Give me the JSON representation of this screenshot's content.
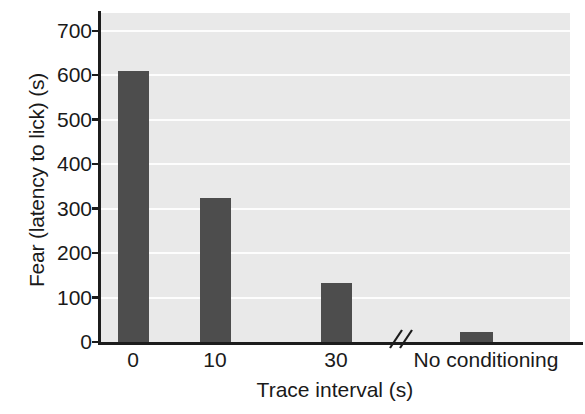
{
  "chart_data": {
    "type": "bar",
    "title": "",
    "xlabel": "Trace interval (s)",
    "ylabel": "Fear (latency to lick) (s)",
    "categories": [
      "0",
      "10",
      "30",
      "No conditioning"
    ],
    "values": [
      610,
      325,
      133,
      22
    ],
    "ylim": [
      0,
      740
    ],
    "yticks": [
      0,
      100,
      200,
      300,
      400,
      500,
      600,
      700
    ],
    "ytick_labels": [
      "0",
      "100",
      "200",
      "300",
      "400",
      "500",
      "600",
      "700"
    ],
    "grid": "horizontal",
    "legend": "none",
    "bar_color": "#4d4d4d",
    "plot_background": "#e9e9e9",
    "gridline_color": "#fdfdfd",
    "axis_color": "#1c1c1c",
    "annotations": [
      {
        "name": "x-axis-break",
        "symbol": "//",
        "description": "double slash axis break between category 30 and No conditioning"
      }
    ]
  },
  "axis": {
    "y_title": "Fear (latency to lick) (s)",
    "x_title": "Trace interval (s)"
  },
  "bars": [
    {
      "label": "0",
      "value": 610,
      "left": 118,
      "width": 31
    },
    {
      "label": "10",
      "value": 325,
      "left": 200,
      "width": 31
    },
    {
      "label": "30",
      "value": 133,
      "left": 321,
      "width": 31
    },
    {
      "label": "No conditioning",
      "value": 22,
      "left": 460,
      "width": 33
    }
  ],
  "xtick_positions": [
    {
      "label": "0",
      "center": 133
    },
    {
      "label": "10",
      "center": 215
    },
    {
      "label": "30",
      "center": 336
    },
    {
      "label": "No conditioning",
      "center": 486
    }
  ]
}
